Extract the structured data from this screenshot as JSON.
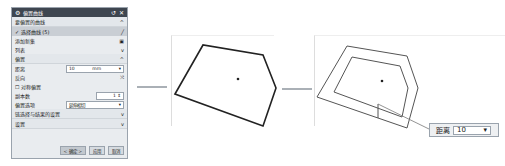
{
  "dialog": {
    "title": "偏置曲线",
    "groups": {
      "curve": {
        "label": "要偏置的曲线",
        "selected_label": "选择曲线 (5)",
        "add_new_label": "添加新集",
        "list_label": "列表"
      },
      "offset": {
        "label": "偏置",
        "distance_label": "距离",
        "distance_value": "10",
        "distance_unit": "mm",
        "direction_label": "反向",
        "symmetric_label": "对称偏置",
        "copies_label": "副本数",
        "copies_value": "1",
        "trim_label": "偏置选项",
        "trim_value": "延伸相切"
      },
      "settings1": {
        "label": "链选择与结果的设置"
      },
      "settings2": {
        "label": "设置"
      }
    },
    "buttons": {
      "ok": "< 确定 >",
      "apply": "应用",
      "cancel": "取消"
    }
  },
  "popup": {
    "label": "距离",
    "value": "10"
  }
}
